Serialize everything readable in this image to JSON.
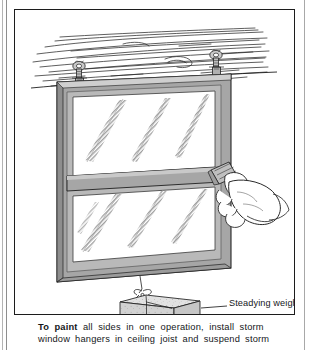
{
  "page": {
    "type": "illustrated-instruction-figure",
    "background": "#ffffff",
    "ink": "#15171a"
  },
  "figure": {
    "border_color": "#1c1c1c",
    "ceiling": {
      "name": "ceiling-joist-boards",
      "grain_line_color": "#2a2a2a",
      "description": "hand drawn horizontal wood grain lines"
    },
    "hangers": [
      {
        "name": "storm-window-hanger-left",
        "x": 78,
        "label": ""
      },
      {
        "name": "storm-window-hanger-right",
        "x": 215,
        "label": ""
      }
    ],
    "window": {
      "name": "storm-window",
      "frame_color": "#a6a6a6",
      "frame_shadow": "#7c7c7c",
      "frame_highlight": "#cfcfcf",
      "glass_color": "#ffffff",
      "reflection_color": "#9b9b9b",
      "panes": 2,
      "reflections_per_pane": 3
    },
    "hand": {
      "name": "hand-with-paint-brush",
      "outline_color": "#2a2a2a",
      "brush_color": "#b5b5b5"
    },
    "weight": {
      "name": "steadying-weight",
      "shape": "brick tied with string",
      "top_color": "#ececec",
      "front_color": "#dcdcdc",
      "side_color": "#c6c6c6"
    },
    "callouts": [
      {
        "name": "callout-steadying-weight",
        "text": "Steadying weight"
      }
    ]
  },
  "caption": {
    "lead_in": "To paint",
    "line_1_rest": "all sides in one operation, install storm",
    "line_2": "window hangers in ceiling joist and suspend storm",
    "full_text": "To paint all sides in one operation, install storm window hangers in ceiling joist and suspend storm"
  }
}
